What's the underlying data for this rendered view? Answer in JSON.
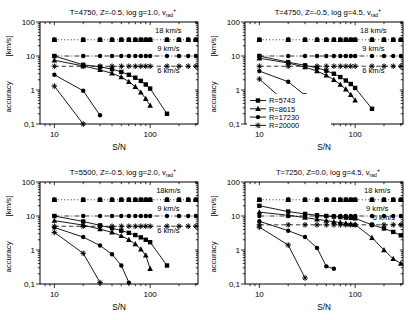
{
  "figure": {
    "bg": "#ffffff",
    "fg": "#000000"
  },
  "legend": {
    "position": "lower-left-of-top-right-panel",
    "items": [
      {
        "label": "R=5743",
        "marker": "square"
      },
      {
        "label": "R=8615",
        "marker": "triangle"
      },
      {
        "label": "R=17230",
        "marker": "circle"
      },
      {
        "label": "R=20000",
        "marker": "star"
      }
    ]
  },
  "chart_data": [
    {
      "id": "top-left",
      "type": "line",
      "title": {
        "main": "T=4750, Z=-0.5, log g=1.0,  v",
        "sub": "rad",
        "sup": "+"
      },
      "xlabel": "S/N",
      "ylabel_upper": "[km/s]",
      "ylabel_lower": "accuracy",
      "xlim": [
        7.08,
        316
      ],
      "ylim": [
        0.1,
        100
      ],
      "grid": false,
      "log_x": true,
      "log_y": true,
      "xticks": [
        {
          "v": 10,
          "label": "10"
        },
        {
          "v": 100,
          "label": "100"
        }
      ],
      "yticks": [
        {
          "v": 100,
          "label": "100"
        },
        {
          "v": 10,
          "label": "10"
        },
        {
          "v": 1,
          "label": "1"
        },
        {
          "v": 0.1,
          "label": "0,1"
        }
      ],
      "annotations": [
        {
          "text": "18 km/s",
          "x": 155,
          "y": 47
        },
        {
          "text": "9 km/s",
          "x": 155,
          "y": 14.5
        },
        {
          "text": "6 km/s",
          "x": 155,
          "y": 3.2
        }
      ],
      "ref_lines": [
        {
          "label": "18 km/s",
          "y": 30,
          "dash": "dotted",
          "marker": "blob",
          "x": [
            10,
            20,
            30,
            40,
            50,
            60,
            70,
            80,
            90,
            100,
            150,
            200,
            250,
            300
          ]
        },
        {
          "label": "9 km/s",
          "y": 10,
          "dash": "dashdot",
          "marker": "circle",
          "x": [
            10,
            20,
            30,
            40,
            50,
            60,
            70,
            80,
            90,
            100,
            150,
            200,
            250,
            300
          ]
        },
        {
          "label": "6 km/s",
          "y": 5,
          "dash": "dashed",
          "marker": "star",
          "x": [
            10,
            20,
            30,
            40,
            50,
            60,
            70,
            80,
            90,
            100,
            150,
            200,
            250,
            300
          ]
        }
      ],
      "series": [
        {
          "name": "R=5743",
          "marker": "square",
          "points": [
            [
              10,
              10
            ],
            [
              20,
              5.5
            ],
            [
              30,
              4.8
            ],
            [
              40,
              4.1
            ],
            [
              50,
              3.4
            ],
            [
              60,
              2.8
            ],
            [
              70,
              2.3
            ],
            [
              80,
              1.85
            ],
            [
              90,
              1.45
            ],
            [
              100,
              1.1
            ],
            [
              150,
              0.2
            ]
          ]
        },
        {
          "name": "R=8615",
          "marker": "triangle",
          "points": [
            [
              10,
              7.5
            ],
            [
              20,
              5.1
            ],
            [
              30,
              3.9
            ],
            [
              40,
              3.1
            ],
            [
              50,
              2.4
            ],
            [
              60,
              1.75
            ],
            [
              70,
              1.25
            ],
            [
              80,
              0.85
            ],
            [
              90,
              0.55
            ],
            [
              100,
              0.35
            ]
          ]
        },
        {
          "name": "R=17230",
          "marker": "circle",
          "points": [
            [
              10,
              2.8
            ],
            [
              20,
              0.95
            ],
            [
              30,
              0.18
            ]
          ]
        },
        {
          "name": "R=20000",
          "marker": "star",
          "points": [
            [
              10,
              1.3
            ],
            [
              20,
              0.1
            ]
          ]
        }
      ],
      "show_legend": false
    },
    {
      "id": "top-right",
      "type": "line",
      "title": {
        "main": "T=4750, Z=-0.5, log g=4.5,   v",
        "sub": "rad",
        "sup": "+"
      },
      "xlabel": "S/N",
      "ylabel_upper": "[km/s]",
      "ylabel_lower": "accuracy",
      "xlim": [
        7.08,
        316
      ],
      "ylim": [
        0.1,
        100
      ],
      "grid": false,
      "log_x": true,
      "log_y": true,
      "xticks": [
        {
          "v": 10,
          "label": "10"
        },
        {
          "v": 100,
          "label": "100"
        }
      ],
      "yticks": [
        {
          "v": 100,
          "label": "100"
        },
        {
          "v": 10,
          "label": "10"
        },
        {
          "v": 1,
          "label": "1"
        },
        {
          "v": 0.1,
          "label": "0,1"
        }
      ],
      "annotations": [
        {
          "text": "18 km/s",
          "x": 155,
          "y": 47
        },
        {
          "text": "9 km/s",
          "x": 155,
          "y": 14.5
        },
        {
          "text": "6 km/s",
          "x": 155,
          "y": 3.2
        }
      ],
      "ref_lines": [
        {
          "label": "18 km/s",
          "y": 30,
          "dash": "dotted",
          "marker": "blob",
          "x": [
            10,
            20,
            30,
            40,
            50,
            60,
            70,
            80,
            90,
            100,
            150,
            200,
            250,
            300
          ]
        },
        {
          "label": "9 km/s",
          "y": 10,
          "dash": "dashdot",
          "marker": "circle",
          "x": [
            10,
            20,
            30,
            40,
            50,
            60,
            70,
            80,
            90,
            100,
            150,
            200,
            250,
            300
          ]
        },
        {
          "label": "6 km/s",
          "y": 5,
          "dash": "dashed",
          "marker": "star",
          "x": [
            10,
            20,
            30,
            40,
            50,
            60,
            70,
            80,
            90,
            100,
            150,
            200,
            250,
            300
          ]
        }
      ],
      "series": [
        {
          "name": "R=5743",
          "marker": "square",
          "points": [
            [
              10,
              10
            ],
            [
              20,
              6.6
            ],
            [
              30,
              5.3
            ],
            [
              40,
              4.5
            ],
            [
              50,
              3.7
            ],
            [
              60,
              3.0
            ],
            [
              70,
              2.4
            ],
            [
              80,
              1.9
            ],
            [
              90,
              1.5
            ],
            [
              100,
              1.15
            ],
            [
              150,
              0.28
            ]
          ]
        },
        {
          "name": "R=8615",
          "marker": "triangle",
          "points": [
            [
              10,
              8.6
            ],
            [
              20,
              6.2
            ],
            [
              30,
              4.7
            ],
            [
              40,
              3.6
            ],
            [
              50,
              2.7
            ],
            [
              60,
              2.0
            ],
            [
              70,
              1.45
            ],
            [
              80,
              1.05
            ],
            [
              90,
              0.72
            ],
            [
              100,
              0.5
            ]
          ]
        },
        {
          "name": "R=17230",
          "marker": "circle",
          "points": [
            [
              10,
              3.6
            ],
            [
              20,
              1.75
            ],
            [
              30,
              0.7
            ],
            [
              40,
              0.22
            ]
          ]
        },
        {
          "name": "R=20000",
          "marker": "star",
          "points": [
            [
              10,
              2.1
            ],
            [
              20,
              0.38
            ]
          ]
        }
      ],
      "show_legend": true
    },
    {
      "id": "bottom-left",
      "type": "line",
      "title": {
        "main": "T=5500, Z=-0.5, log g=2.0, v",
        "sub": "rad",
        "sup": "+"
      },
      "xlabel": "S/N",
      "ylabel_upper": "[km/s]",
      "ylabel_lower": "accuracy",
      "xlim": [
        7.08,
        316
      ],
      "ylim": [
        0.1,
        100
      ],
      "grid": false,
      "log_x": true,
      "log_y": true,
      "xticks": [
        {
          "v": 10,
          "label": "10"
        },
        {
          "v": 100,
          "label": "100"
        }
      ],
      "yticks": [
        {
          "v": 100,
          "label": "100"
        },
        {
          "v": 10,
          "label": "10"
        },
        {
          "v": 1,
          "label": "1"
        },
        {
          "v": 0.1,
          "label": "0,1"
        }
      ],
      "annotations": [
        {
          "text": "18km/s",
          "x": 155,
          "y": 47
        },
        {
          "text": "9 km/s",
          "x": 155,
          "y": 14.5
        },
        {
          "text": "6 km/s",
          "x": 155,
          "y": 3.2
        }
      ],
      "ref_lines": [
        {
          "label": "18 km/s",
          "y": 30,
          "dash": "dotted",
          "marker": "blob",
          "x": [
            10,
            20,
            30,
            40,
            50,
            60,
            70,
            80,
            90,
            100,
            150,
            200,
            250,
            300
          ]
        },
        {
          "label": "9 km/s",
          "y": 10,
          "dash": "dashdot",
          "marker": "circle",
          "x": [
            10,
            20,
            30,
            40,
            50,
            60,
            70,
            80,
            90,
            100,
            150,
            200,
            250,
            300
          ]
        },
        {
          "label": "6 km/s",
          "y": 5,
          "dash": "dashed",
          "marker": "star",
          "x": [
            10,
            20,
            30,
            40,
            50,
            60,
            70,
            80,
            90,
            100,
            150,
            200,
            250,
            300
          ]
        }
      ],
      "series": [
        {
          "name": "R=5743",
          "marker": "square",
          "points": [
            [
              10,
              10
            ],
            [
              20,
              6.9
            ],
            [
              30,
              5.3
            ],
            [
              40,
              4.4
            ],
            [
              50,
              3.7
            ],
            [
              60,
              3.2
            ],
            [
              70,
              2.75
            ],
            [
              80,
              2.35
            ],
            [
              90,
              2.0
            ],
            [
              100,
              1.7
            ],
            [
              150,
              0.35
            ]
          ]
        },
        {
          "name": "R=8615",
          "marker": "triangle",
          "points": [
            [
              10,
              7.3
            ],
            [
              20,
              5.4
            ],
            [
              30,
              4.1
            ],
            [
              40,
              3.3
            ],
            [
              50,
              2.6
            ],
            [
              60,
              2.0
            ],
            [
              70,
              1.5
            ],
            [
              80,
              1.05
            ],
            [
              90,
              0.7
            ],
            [
              100,
              0.28
            ]
          ]
        },
        {
          "name": "R=17230",
          "marker": "circle",
          "points": [
            [
              10,
              4.6
            ],
            [
              20,
              2.4
            ],
            [
              30,
              1.35
            ],
            [
              40,
              0.75
            ],
            [
              50,
              0.35
            ],
            [
              60,
              0.11
            ]
          ]
        },
        {
          "name": "R=20000",
          "marker": "star",
          "points": [
            [
              10,
              3.3
            ],
            [
              20,
              0.8
            ],
            [
              30,
              0.11
            ]
          ]
        }
      ],
      "show_legend": false
    },
    {
      "id": "bottom-right",
      "type": "line",
      "title": {
        "main": "T=7250, Z=0.0, log g=4.5,  v",
        "sub": "rad",
        "sup": "+"
      },
      "xlabel": "S/N",
      "ylabel_upper": "[km/s]",
      "ylabel_lower": "accuracy",
      "xlim": [
        7.08,
        316
      ],
      "ylim": [
        0.1,
        100
      ],
      "grid": false,
      "log_x": true,
      "log_y": true,
      "xticks": [
        {
          "v": 10,
          "label": "10"
        },
        {
          "v": 100,
          "label": "100"
        }
      ],
      "yticks": [
        {
          "v": 100,
          "label": "100"
        },
        {
          "v": 10,
          "label": "10"
        },
        {
          "v": 1,
          "label": "1"
        },
        {
          "v": 0.1,
          "label": "0,1"
        }
      ],
      "annotations": [
        {
          "text": "18 km/s",
          "x": 170,
          "y": 47
        },
        {
          "text": "9 km/s",
          "x": 170,
          "y": 14.5
        },
        {
          "text": "6 km/s",
          "x": 200,
          "y": 7.6
        }
      ],
      "ref_lines": [
        {
          "label": "18 km/s",
          "y": 30,
          "dash": "dotted",
          "marker": "blob",
          "x": [
            10,
            20,
            30,
            40,
            50,
            60,
            70,
            80,
            90,
            100,
            150,
            200,
            250,
            300
          ]
        },
        {
          "label": "9 km/s",
          "y": 10,
          "dash": "dashdot",
          "marker": "circle",
          "x": [
            10,
            20,
            30,
            40,
            50,
            60,
            70,
            80,
            90,
            100,
            150,
            200,
            250,
            300
          ]
        },
        {
          "label": "6 km/s",
          "y": 5.5,
          "dash": "dashed",
          "marker": "star",
          "x": [
            10,
            20,
            30,
            40,
            50,
            60,
            70,
            80,
            90,
            100,
            150,
            200,
            250,
            300
          ]
        }
      ],
      "series": [
        {
          "name": "R=5743",
          "marker": "square",
          "points": [
            [
              10,
              20
            ],
            [
              20,
              13.5
            ],
            [
              30,
              11.5
            ],
            [
              40,
              10.5
            ],
            [
              50,
              10
            ],
            [
              60,
              9.6
            ],
            [
              70,
              9.3
            ],
            [
              80,
              9.0
            ],
            [
              90,
              8.8
            ],
            [
              100,
              8.5
            ],
            [
              150,
              5.5
            ],
            [
              200,
              4.3
            ],
            [
              250,
              3.4
            ],
            [
              300,
              2.7
            ]
          ]
        },
        {
          "name": "R=8615",
          "marker": "triangle",
          "points": [
            [
              10,
              13
            ],
            [
              20,
              10.5
            ],
            [
              30,
              9.0
            ],
            [
              40,
              8.0
            ],
            [
              50,
              7.3
            ],
            [
              60,
              6.8
            ],
            [
              70,
              6.4
            ],
            [
              80,
              6.1
            ],
            [
              90,
              5.8
            ],
            [
              100,
              5.6
            ],
            [
              150,
              2.3
            ],
            [
              200,
              1.0
            ],
            [
              250,
              0.55
            ],
            [
              300,
              0.4
            ]
          ]
        },
        {
          "name": "R=17230",
          "marker": "circle",
          "points": [
            [
              10,
              7
            ],
            [
              20,
              3.7
            ],
            [
              30,
              2.4
            ],
            [
              40,
              1.15
            ],
            [
              50,
              0.33
            ],
            [
              60,
              0.28
            ]
          ]
        },
        {
          "name": "R=20000",
          "marker": "star",
          "points": [
            [
              10,
              4.7
            ],
            [
              20,
              1.4
            ],
            [
              30,
              0.15
            ]
          ]
        }
      ],
      "show_legend": false
    }
  ]
}
